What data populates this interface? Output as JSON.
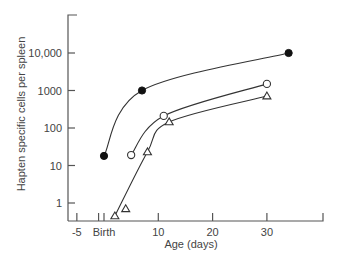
{
  "chart_data": {
    "type": "line",
    "title": "",
    "xlabel": "Age (days)",
    "ylabel": "Hapten specific cells per spleen",
    "xscale": "linear",
    "yscale": "log",
    "xlim": [
      -5,
      40
    ],
    "ylim": [
      0.4,
      50000
    ],
    "grid": false,
    "legend": null,
    "x_ticks": [
      {
        "value": -5,
        "label": "-5"
      },
      {
        "value": 0,
        "label": "Birth"
      },
      {
        "value": 10,
        "label": "10"
      },
      {
        "value": 20,
        "label": "20"
      },
      {
        "value": 30,
        "label": "30"
      }
    ],
    "y_ticks": [
      {
        "value": 1,
        "label": "1"
      },
      {
        "value": 10,
        "label": "10"
      },
      {
        "value": 100,
        "label": "100"
      },
      {
        "value": 1000,
        "label": "1000"
      },
      {
        "value": 10000,
        "label": "10,000"
      }
    ],
    "series": [
      {
        "name": "filled-circle",
        "marker": "filled-circle",
        "points": [
          {
            "x": 0,
            "y": 18
          },
          {
            "x": 7,
            "y": 1000
          },
          {
            "x": 34,
            "y": 10000
          }
        ]
      },
      {
        "name": "open-circle",
        "marker": "open-circle",
        "points": [
          {
            "x": 5,
            "y": 19
          },
          {
            "x": 11,
            "y": 210
          },
          {
            "x": 30,
            "y": 1500
          }
        ]
      },
      {
        "name": "open-triangle",
        "marker": "open-triangle",
        "points": [
          {
            "x": 2,
            "y": 0.45
          },
          {
            "x": 4,
            "y": 0.7
          },
          {
            "x": 8,
            "y": 23
          },
          {
            "x": 12,
            "y": 145
          },
          {
            "x": 30,
            "y": 710
          }
        ]
      }
    ]
  }
}
